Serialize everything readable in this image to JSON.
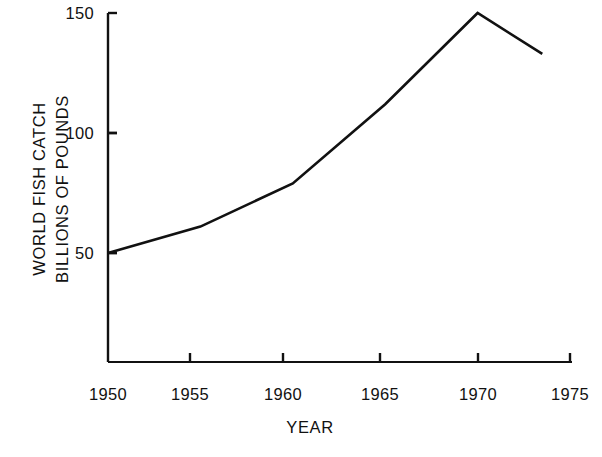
{
  "chart_data": {
    "type": "line",
    "title": "",
    "xlabel": "YEAR",
    "ylabel": "WORLD FISH CATCH BILLIONS OF POUNDS",
    "ylabel_lines": [
      "WORLD FISH CATCH",
      "BILLIONS OF POUNDS"
    ],
    "x": [
      1950,
      1955,
      1960,
      1965,
      1970,
      1973.5
    ],
    "values": [
      50,
      61,
      79,
      112,
      150,
      133
    ],
    "series": [
      {
        "name": "World fish catch",
        "values": [
          50,
          61,
          79,
          112,
          150,
          133
        ]
      }
    ],
    "xlim": [
      1950,
      1975
    ],
    "ylim": [
      0,
      150
    ],
    "xticks": [
      1950,
      1955,
      1960,
      1965,
      1970,
      1975
    ],
    "xtick_labels": [
      "1950",
      "1955",
      "1960",
      "1965",
      "1970",
      "1975"
    ],
    "yticks": [
      50,
      100,
      150
    ],
    "ytick_labels": [
      "50",
      "100",
      "150"
    ],
    "grid": false,
    "legend": false,
    "legend_position": "none",
    "line_color": "#111111",
    "background_color": "#ffffff"
  },
  "axes": {
    "y_title_line1": "WORLD FISH CATCH",
    "y_title_line2": "BILLIONS OF POUNDS",
    "x_title": "YEAR",
    "ytick_0": "50",
    "ytick_1": "100",
    "ytick_2": "150",
    "xtick_0": "1950",
    "xtick_1": "1955",
    "xtick_2": "1960",
    "xtick_3": "1965",
    "xtick_4": "1970",
    "xtick_5": "1975"
  }
}
